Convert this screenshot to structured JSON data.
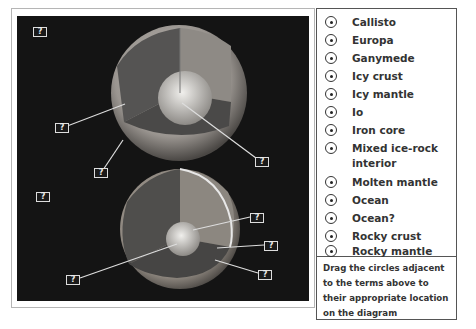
{
  "diagram": {
    "label_placeholder": "?",
    "top_moon_labels": [
      {
        "id": "t1",
        "x": 16,
        "y": 11
      },
      {
        "id": "t2",
        "x": 38,
        "y": 107
      },
      {
        "id": "t3",
        "x": 77,
        "y": 152
      },
      {
        "id": "t4",
        "x": 238,
        "y": 141
      }
    ],
    "bottom_moon_labels": [
      {
        "id": "b1",
        "x": 19,
        "y": 176
      },
      {
        "id": "b2",
        "x": 233,
        "y": 197
      },
      {
        "id": "b3",
        "x": 247,
        "y": 225
      },
      {
        "id": "b4",
        "x": 241,
        "y": 254
      },
      {
        "id": "b5",
        "x": 49,
        "y": 259
      }
    ]
  },
  "terms": [
    {
      "label": "Callisto",
      "top": 12
    },
    {
      "label": "Europa",
      "top": 30
    },
    {
      "label": "Ganymede",
      "top": 48
    },
    {
      "label": "Icy crust",
      "top": 66
    },
    {
      "label": "Icy mantle",
      "top": 84
    },
    {
      "label": "Io",
      "top": 102
    },
    {
      "label": "Iron core",
      "top": 120
    },
    {
      "label": "Mixed ice-rock interior",
      "top": 138
    },
    {
      "label": "Molten mantle",
      "top": 171
    },
    {
      "label": "Ocean",
      "top": 189
    },
    {
      "label": "Ocean?",
      "top": 207
    },
    {
      "label": "Rocky crust",
      "top": 225
    },
    {
      "label": "Rocky mantle",
      "top": 243
    }
  ],
  "instructions": "Drag the circles adjacent to the terms above to their appropriate location on the diagram"
}
